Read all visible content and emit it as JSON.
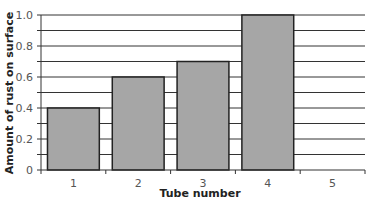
{
  "chart_data": {
    "type": "bar",
    "title": "",
    "xlabel": "Tube number",
    "ylabel": "Amount of rust on surface",
    "categories": [
      "1",
      "2",
      "3",
      "4",
      "5"
    ],
    "values": [
      0.4,
      0.6,
      0.7,
      1.0,
      null
    ],
    "ylim": [
      0,
      1.0
    ],
    "yticks": [
      "0",
      "0.2",
      "0.4",
      "0.6",
      "0.8",
      "1.0"
    ],
    "grid": true,
    "grid_step": 0.1,
    "legend": null,
    "bar_color": "#a6a6a6",
    "bar_edge_color": "#222222"
  }
}
